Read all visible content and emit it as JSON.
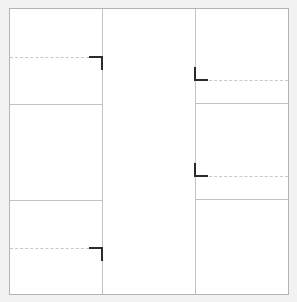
{
  "diagram": {
    "type": "three-column-panel-layout-with-alignment-markers",
    "colors": {
      "background": "#f2f2f2",
      "panel": "#ffffff",
      "frame_border": "#b4b4b4",
      "grid_line": "#c2c2c2",
      "dashed_guide": "#c8c8c8",
      "marker": "#2b2b2b"
    },
    "frame": {
      "x": 9,
      "y": 8,
      "width": 280,
      "height": 287
    },
    "columns": [
      {
        "name": "left",
        "x_start": 9,
        "x_end": 102,
        "row_dividers_y": [
          104,
          200
        ]
      },
      {
        "name": "center",
        "x_start": 102,
        "x_end": 195,
        "row_dividers_y": []
      },
      {
        "name": "right",
        "x_start": 195,
        "x_end": 289,
        "row_dividers_y": [
          103,
          199
        ]
      }
    ],
    "markers": [
      {
        "shape": "corner-top-right",
        "x": 89,
        "y": 57,
        "size": 13,
        "guide": {
          "from_x": 9,
          "to_x": 89,
          "y": 57
        }
      },
      {
        "shape": "corner-top-right",
        "x": 89,
        "y": 248,
        "size": 13,
        "guide": {
          "from_x": 9,
          "to_x": 89,
          "y": 248
        }
      },
      {
        "shape": "corner-bottom-left",
        "x": 195,
        "y": 67,
        "size": 13,
        "guide": {
          "from_x": 208,
          "to_x": 289,
          "y": 80
        }
      },
      {
        "shape": "corner-bottom-left",
        "x": 195,
        "y": 163,
        "size": 13,
        "guide": {
          "from_x": 208,
          "to_x": 289,
          "y": 176
        }
      }
    ]
  }
}
